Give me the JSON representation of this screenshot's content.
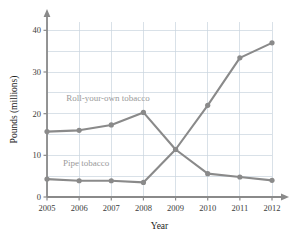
{
  "chart_data": {
    "type": "line",
    "title": "",
    "xlabel": "Year",
    "ylabel": "Pounds (millions)",
    "categories": [
      "2005",
      "2006",
      "2007",
      "2008",
      "2009",
      "2010",
      "2011",
      "2012"
    ],
    "x": [
      2005,
      2006,
      2007,
      2008,
      2009,
      2010,
      2011,
      2012
    ],
    "xlim": [
      2005,
      2012
    ],
    "ylim": [
      0,
      42
    ],
    "yticks": [
      0,
      10,
      20,
      30,
      40
    ],
    "ytick_labels": [
      "0",
      "10",
      "20",
      "30",
      "40"
    ],
    "minor_gridlines": [
      5,
      15,
      25,
      35
    ],
    "grid": true,
    "legend_position": "inline-annotation",
    "series": [
      {
        "name": "Roll-your-own tobacco",
        "values": [
          15.7,
          16.0,
          17.3,
          20.3,
          11.4,
          5.6,
          4.8,
          4.0
        ],
        "color": "#8a8a8a",
        "label_x": 2005.6,
        "label_y": 23.0
      },
      {
        "name": "Pipe tobacco",
        "values": [
          4.3,
          3.9,
          3.9,
          3.5,
          11.4,
          22.0,
          33.4,
          37.0
        ],
        "color": "#8a8a8a",
        "label_x": 2005.5,
        "label_y": 7.4
      }
    ],
    "colors": {
      "line": "#8a8a8a",
      "marker": "#8a8a8a",
      "axis": "#8a8a8a",
      "grid": "#c9d4de",
      "text": "#3b3b3b"
    }
  }
}
